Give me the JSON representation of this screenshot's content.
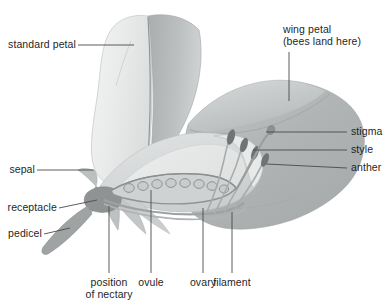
{
  "figure": {
    "background_color": "#ffffff",
    "line_color": "#3a3a3a",
    "text_color": "#1f1f1f",
    "palette": {
      "standard_petal_front": "#eceded",
      "standard_petal_fold": "#b9bcbd",
      "wing_petal": "#b4b8b9",
      "keel_petal": "#d4d7d7",
      "inner_cavity": "#e4e6e6",
      "ovary_wall": "#9ea2a3",
      "ovule": "#c8cbcb",
      "stalk": "#9a9e9f",
      "receptacle": "#8c9091",
      "anther": "#6e7374",
      "filament": "#a8acad"
    }
  },
  "labels": {
    "standard_petal": "standard petal",
    "wing_petal_line1": "wing petal",
    "wing_petal_line2": "(bees land here)",
    "sepal": "sepal",
    "receptacle": "receptacle",
    "pedicel": "pedicel",
    "stigma": "stigma",
    "style": "style",
    "anther": "anther",
    "position_of_nectary_line1": "position",
    "position_of_nectary_line2": "of nectary",
    "ovule": "ovule",
    "ovary": "ovary",
    "filament": "filament"
  },
  "structures": {
    "ovule_count": 8,
    "anther_count": 4
  }
}
